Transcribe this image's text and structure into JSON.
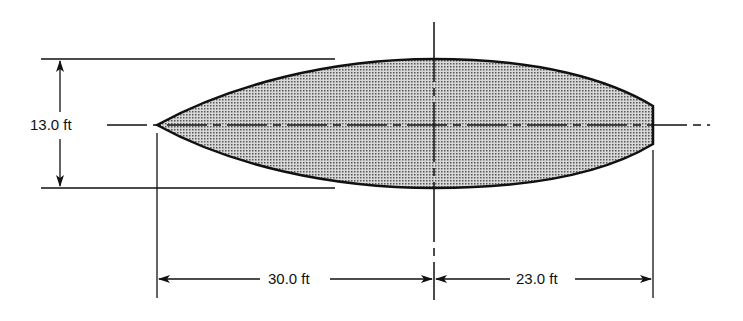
{
  "diagram": {
    "type": "airfoil-like streamlined body cross-section, dimensioned",
    "shape_fill": "#b8b8b8",
    "stroke_color": "#111111",
    "dimensions": {
      "height": {
        "label": "13.0 ft",
        "value": 13.0,
        "unit": "ft"
      },
      "front_length": {
        "label": "30.0 ft",
        "value": 30.0,
        "unit": "ft"
      },
      "rear_length": {
        "label": "23.0 ft",
        "value": 23.0,
        "unit": "ft"
      }
    }
  }
}
